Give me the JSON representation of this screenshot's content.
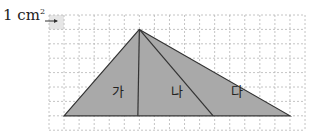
{
  "unit_label": {
    "text": "1 cm",
    "superscript": "2"
  },
  "grid": {
    "origin_x": 49,
    "origin_y": 15,
    "cell_w": 15.06,
    "cell_h": 14.4,
    "cols": 17,
    "rows": 8,
    "line_color": "#b5b5b5",
    "unit_cell_fill": "#e6e6e6"
  },
  "triangle": {
    "fill": "#a9a9a9",
    "stroke": "#333333",
    "apex": [
      6,
      1
    ],
    "base_left": [
      1,
      7
    ],
    "base_right": [
      16,
      7
    ],
    "dividers": [
      [
        5.9,
        7
      ],
      [
        10.9,
        7
      ]
    ]
  },
  "regions": [
    {
      "label": "가",
      "pos": [
        4.6,
        5.6
      ]
    },
    {
      "label": "나",
      "pos": [
        8.5,
        5.6
      ]
    },
    {
      "label": "다",
      "pos": [
        12.5,
        5.6
      ]
    }
  ]
}
